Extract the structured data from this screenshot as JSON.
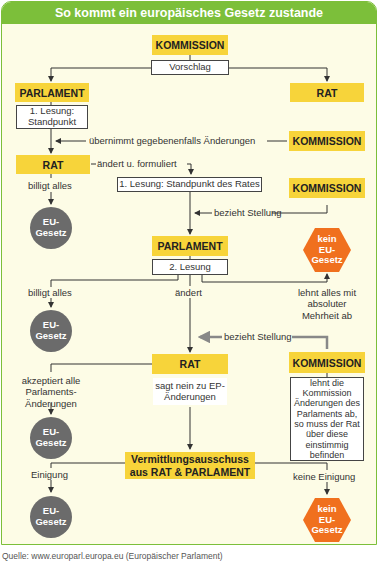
{
  "header": {
    "title": "So kommt ein europäisches Gesetz zustande"
  },
  "colors": {
    "header_green": "#7cbf3a",
    "institution_yellow": "#f7d43a",
    "eu_law_gray": "#6b6b6b",
    "no_law_orange": "#f0701e",
    "background": "#fdfce6"
  },
  "nodes": {
    "kommission_top": "KOMMISSION",
    "vorschlag": "Vorschlag",
    "parlament_1": "PARLAMENT",
    "rat_1": "RAT",
    "lesung_1_parlament": "1. Lesung: Standpunkt",
    "kommission_2": "KOMMISSION",
    "rat_2": "RAT",
    "lesung_1_rat": "1. Lesung: Standpunkt des Rates",
    "kommission_3": "KOMMISSION",
    "eu_gesetz_1": "EU-Gesetz",
    "parlament_2": "PARLAMENT",
    "lesung_2": "2. Lesung",
    "kein_gesetz_1": "kein EU-Gesetz",
    "eu_gesetz_2": "EU-Gesetz",
    "rat_3": "RAT",
    "kommission_4": "KOMMISSION",
    "kommission_note": "lehnt die Kommission Änderungen des Parlaments ab, so muss der Rat über diese einstimmig befinden",
    "eu_gesetz_3": "EU-Gesetz",
    "vermittlung_1": "Vermittlungsausschuss",
    "vermittlung_2": "aus RAT & PARLAMENT",
    "eu_gesetz_4": "EU-Gesetz",
    "kein_gesetz_2": "kein EU-Gesetz"
  },
  "labels": {
    "uebernimmt": "übernimmt gegebenenfalls Änderungen",
    "aendert_formuliert": "ändert u. formuliert",
    "billigt_1": "billigt alles",
    "bezieht_1": "bezieht Stellung",
    "billigt_2": "billigt alles",
    "aendert": "ändert",
    "lehnt_1": "lehnt alles mit",
    "lehnt_2": "absoluter",
    "lehnt_3": "Mehrheit ab",
    "bezieht_2": "bezieht Stellung",
    "akzeptiert_1": "akzeptiert alle",
    "akzeptiert_2": "Parlaments-",
    "akzeptiert_3": "Änderungen",
    "sagt_nein_1": "sagt nein zu EP-",
    "sagt_nein_2": "Änderungen",
    "einigung": "Einigung",
    "keine_einigung": "keine Einigung"
  },
  "source": "Quelle:  www.europarl.europa.eu (Europäischer Parlament)"
}
